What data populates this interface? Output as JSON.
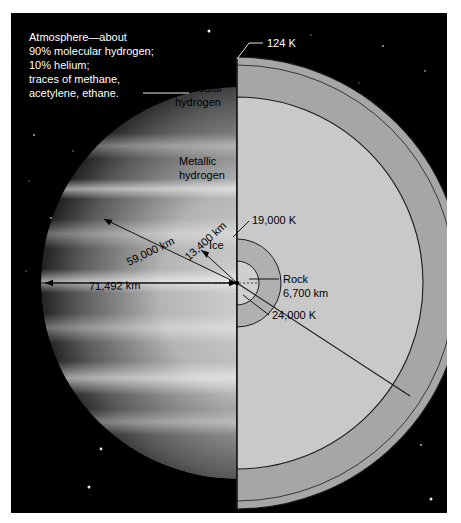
{
  "figure": {
    "background_color": "#000000",
    "frame_color": "#ffffff"
  },
  "callouts": {
    "atmosphere": "Atmosphere—about\n90% molecular hydrogen;\n10% helium;\ntraces of methane,\nacetylene, ethane.",
    "atmosphere_lines": [
      "Atmosphere—about",
      "90% molecular hydrogen;",
      "10% helium;",
      "traces of methane,",
      "acetylene, ethane."
    ],
    "top_temperature": "124 K"
  },
  "layers": [
    {
      "name": "Molecular hydrogen",
      "label_lines": [
        "Molecular",
        "hydrogen"
      ],
      "fill": "#a6a6a6",
      "outer_radius_km": 71492
    },
    {
      "name": "Metallic hydrogen",
      "label_lines": [
        "Metallic",
        "hydrogen"
      ],
      "fill": "#c9c9c9",
      "outer_radius_km": 59000
    },
    {
      "name": "Ice",
      "label_lines": [
        "Ice"
      ],
      "fill": "#b0b0b0",
      "outer_radius_km": 13400
    },
    {
      "name": "Rock",
      "label_lines": [
        "Rock",
        "6,700 km"
      ],
      "fill": "#cfcfcf",
      "outer_radius_km": 6700
    }
  ],
  "dimensions": [
    {
      "label": "71,492 km",
      "value": 71492,
      "unit": "km",
      "of": "Molecular hydrogen outer radius"
    },
    {
      "label": "59,000 km",
      "value": 59000,
      "unit": "km",
      "of": "Metallic hydrogen outer radius"
    },
    {
      "label": "13,400 km",
      "value": 13400,
      "unit": "km",
      "of": "Ice layer outer radius"
    },
    {
      "label": "6,700 km",
      "value": 6700,
      "unit": "km",
      "of": "Rock core radius"
    }
  ],
  "temperatures": [
    {
      "label": "124 K",
      "value": 124,
      "unit": "K",
      "at": "cloud tops"
    },
    {
      "label": "19,000 K",
      "value": 19000,
      "unit": "K",
      "at": "ice layer boundary"
    },
    {
      "label": "24,000 K",
      "value": 24000,
      "unit": "K",
      "at": "rock core"
    }
  ],
  "labels": {
    "molecular_hydrogen_1": "Molecular",
    "molecular_hydrogen_2": "hydrogen",
    "metallic_hydrogen_1": "Metallic",
    "metallic_hydrogen_2": "hydrogen",
    "ice": "Ice",
    "rock_1": "Rock",
    "rock_2": "6,700 km",
    "temp_top": "124 K",
    "temp_ice": "19,000 K",
    "temp_core": "24,000 K",
    "dim_outer": "71,492 km",
    "dim_metallic": "59,000 km",
    "dim_ice": "13,400 km"
  }
}
